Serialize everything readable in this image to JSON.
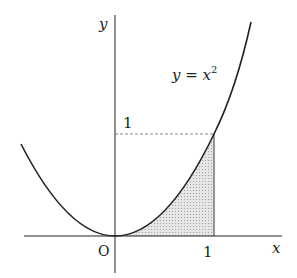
{
  "diagram": {
    "curve_label": "y = x",
    "curve_label_exponent": "2",
    "axis_x_label": "x",
    "axis_y_label": "y",
    "origin_label": "O",
    "x_tick_label": "1",
    "y_tick_label": "1",
    "colors": {
      "line": "#222222",
      "shade": "#d9d9d9",
      "dashed": "#666666"
    }
  }
}
